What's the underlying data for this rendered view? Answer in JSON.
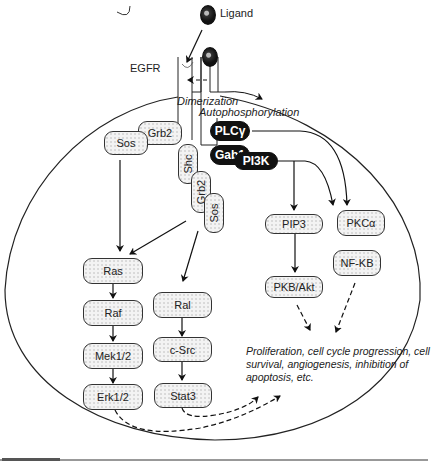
{
  "diagram": {
    "type": "signaling-pathway",
    "labels": {
      "ligand": "Ligand",
      "receptor": "EGFR",
      "dimerization": "Dimerization",
      "autophosphorylation": "Autophosphorylation"
    },
    "nodes": {
      "sos_left": "Sos",
      "grb2_left": "Grb2",
      "shc": "Shc",
      "grb2_mid": "Grb2",
      "sos_mid": "Sos",
      "plcg": "PLCγ",
      "gab1": "Gab1",
      "pi3k": "PI3K",
      "pip3": "PIP3",
      "pkca": "PKCα",
      "pkb_akt": "PKB/Akt",
      "nfkb": "NF-KB",
      "ras": "Ras",
      "raf": "Raf",
      "mek": "Mek1/2",
      "erk": "Erk1/2",
      "ral": "Ral",
      "csrc": "c-Src",
      "stat3": "Stat3"
    },
    "outcome": "Proliferation, cell cycle progression, cell survival, angiogenesis, inhibition of apoptosis, etc.",
    "edges": [
      {
        "from": "Ligand",
        "to": "EGFR",
        "style": "solid"
      },
      {
        "from": "EGFR",
        "to": "EGFR",
        "label": "Dimerization",
        "style": "dashed"
      },
      {
        "from": "Sos/Grb2",
        "to": "Ras",
        "style": "solid"
      },
      {
        "from": "Shc/Grb2/Sos",
        "to": "Ras",
        "style": "solid"
      },
      {
        "from": "Shc/Grb2/Sos",
        "to": "Ral",
        "style": "solid"
      },
      {
        "from": "Ras",
        "to": "Raf",
        "style": "solid"
      },
      {
        "from": "Raf",
        "to": "Mek1/2",
        "style": "solid"
      },
      {
        "from": "Mek1/2",
        "to": "Erk1/2",
        "style": "solid"
      },
      {
        "from": "Ral",
        "to": "c-Src",
        "style": "solid"
      },
      {
        "from": "c-Src",
        "to": "Stat3",
        "style": "solid"
      },
      {
        "from": "PI3K",
        "to": "PIP3",
        "style": "solid"
      },
      {
        "from": "PI3K",
        "to": "PKCα",
        "style": "solid"
      },
      {
        "from": "PLCγ",
        "to": "PKCα",
        "style": "solid"
      },
      {
        "from": "PIP3",
        "to": "PKB/Akt",
        "style": "solid"
      },
      {
        "from": "PKB/Akt",
        "to": "Outcome",
        "style": "dashed"
      },
      {
        "from": "NF-KB",
        "to": "Outcome",
        "style": "dashed"
      },
      {
        "from": "Erk1/2",
        "to": "Outcome",
        "style": "dashed"
      },
      {
        "from": "Stat3",
        "to": "Outcome",
        "style": "dashed"
      }
    ]
  }
}
